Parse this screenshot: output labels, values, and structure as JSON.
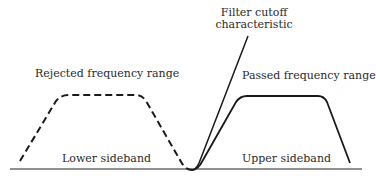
{
  "diagram": {
    "labels": {
      "filter_cutoff_line1": "Filter cutoff",
      "filter_cutoff_line2": "characteristic",
      "rejected": "Rejected frequency range",
      "passed": "Passed frequency range",
      "lower_sideband": "Lower sideband",
      "upper_sideband": "Upper sideband"
    },
    "colors": {
      "line": "#1a1a1a",
      "baseline": "#6b6b6b",
      "text": "#2a2a2a"
    }
  }
}
